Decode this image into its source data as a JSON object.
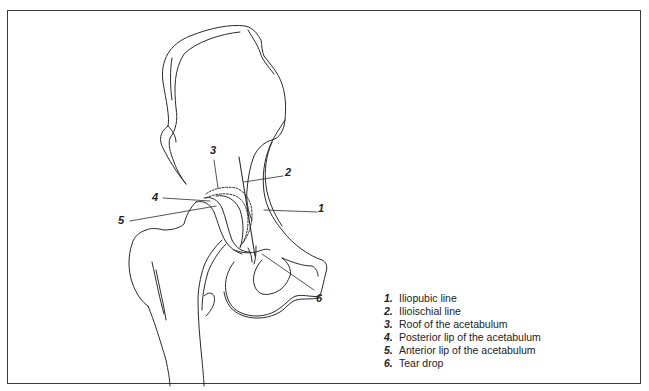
{
  "figure": {
    "line_color": "#2a2a2a",
    "border_color": "#3a3a3a"
  },
  "callouts": [
    {
      "number": "1",
      "x": 318,
      "y": 209
    },
    {
      "number": "2",
      "x": 285,
      "y": 173
    },
    {
      "number": "3",
      "x": 210,
      "y": 149
    },
    {
      "number": "4",
      "x": 152,
      "y": 195
    },
    {
      "number": "5",
      "x": 118,
      "y": 218
    },
    {
      "number": "6",
      "x": 316,
      "y": 292
    }
  ],
  "legend": {
    "items": [
      {
        "number": "1.",
        "label": "Iliopubic line"
      },
      {
        "number": "2.",
        "label": "Ilioischial line"
      },
      {
        "number": "3.",
        "label": "Roof of the acetabulum"
      },
      {
        "number": "4.",
        "label": "Posterior lip of the acetabulum"
      },
      {
        "number": "5.",
        "label": "Anterior lip of the acetabulum"
      },
      {
        "number": "6.",
        "label": "Tear drop"
      }
    ]
  }
}
